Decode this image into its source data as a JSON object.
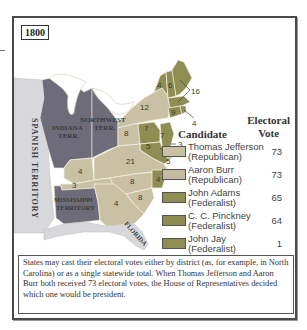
{
  "map": {
    "year": "1800",
    "colors": {
      "republican": "#c9c1a3",
      "federalist": "#8f8e52",
      "territory": "#6e6c78",
      "spanish": "#d8d8dc",
      "water": "#ffffff",
      "border": "#f2efe4"
    },
    "region_labels": {
      "spanish_territory": "SPANISH TERRITORY",
      "indiana_line1": "INDIANA",
      "indiana_line2": "TERR.",
      "northwest_line1": "NORTHWEST",
      "northwest_line2": "TERR.",
      "mississippi_line1": "MISSISSIPPI",
      "mississippi_line2": "TERRITORY",
      "florida": "FLORIDA"
    },
    "state_votes": {
      "vermont": "4",
      "new_hampshire": "6",
      "massachusetts": "16",
      "rhode_island": "4",
      "connecticut": "9",
      "new_york": "12",
      "pennsylvania_left": "8",
      "new_jersey": "7",
      "delaware_area": "7",
      "delaware": "3",
      "maryland": "5",
      "maryland_callout": "5",
      "virginia": "21",
      "kentucky": "4",
      "tennessee": "3",
      "north_carolina_rep": "8",
      "north_carolina_fed": "4",
      "south_carolina": "8",
      "georgia": "4"
    }
  },
  "legend": {
    "header_candidate": "Candidate",
    "header_vote_line1": "Electoral",
    "header_vote_line2": "Vote",
    "items": [
      {
        "name": "Thomas Jefferson",
        "party": "(Republican)",
        "votes": "73",
        "color": "#c9c1a3"
      },
      {
        "name": "Aaron Burr",
        "party": "(Republican)",
        "votes": "73",
        "color": "#c4bca0"
      },
      {
        "name": "John Adams",
        "party": "(Federalist)",
        "votes": "65",
        "color": "#8f8e52"
      },
      {
        "name": "C. C. Pinckney",
        "party": "(Federalist)",
        "votes": "64",
        "color": "#8c8b50"
      },
      {
        "name": "John Jay",
        "party": "(Federalist)",
        "votes": "1",
        "color": "#8f8e52"
      }
    ]
  },
  "note": "States may cast their electoral votes either by district (as, for example, in North Carolina) or as a single statewide total. When Thomas Jefferson and Aaron Burr both received 73 electoral votes, the House of Representatives decided which one would be president."
}
